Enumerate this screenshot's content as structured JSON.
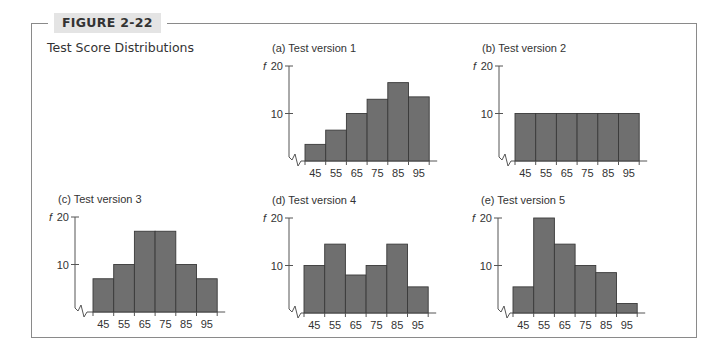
{
  "figure": {
    "label": "FIGURE 2-22",
    "title": "Test Score Distributions"
  },
  "style": {
    "bar_fill": "#6f6f6f",
    "bar_stroke": "#3a3a3a",
    "axis_color": "#555555",
    "frame_color": "#8a8a8a",
    "label_bg": "#e4e4e4"
  },
  "chart_data": [
    {
      "type": "bar",
      "title": "(a)  Test version 1",
      "xlabel": "",
      "ylabel": "f",
      "categories": [
        "45",
        "55",
        "65",
        "75",
        "85",
        "95"
      ],
      "values": [
        3.5,
        6.5,
        10,
        13,
        16.5,
        13.5
      ],
      "yticks": [
        10,
        20
      ],
      "ylim": [
        0,
        20
      ],
      "grid": false,
      "axis_break": true
    },
    {
      "type": "bar",
      "title": "(b)  Test version 2",
      "xlabel": "",
      "ylabel": "f",
      "categories": [
        "45",
        "55",
        "65",
        "75",
        "85",
        "95"
      ],
      "values": [
        10,
        10,
        10,
        10,
        10,
        10
      ],
      "yticks": [
        10,
        20
      ],
      "ylim": [
        0,
        20
      ],
      "grid": false,
      "axis_break": true
    },
    {
      "type": "bar",
      "title": "(c)  Test version 3",
      "xlabel": "",
      "ylabel": "f",
      "categories": [
        "45",
        "55",
        "65",
        "75",
        "85",
        "95"
      ],
      "values": [
        7,
        10,
        17,
        17,
        10,
        7
      ],
      "yticks": [
        10,
        20
      ],
      "ylim": [
        0,
        20
      ],
      "grid": false,
      "axis_break": true
    },
    {
      "type": "bar",
      "title": "(d)  Test version 4",
      "xlabel": "",
      "ylabel": "f",
      "categories": [
        "45",
        "55",
        "65",
        "75",
        "85",
        "95"
      ],
      "values": [
        10,
        14.5,
        8,
        10,
        14.5,
        5.5
      ],
      "yticks": [
        10,
        20
      ],
      "ylim": [
        0,
        20
      ],
      "grid": false,
      "axis_break": true
    },
    {
      "type": "bar",
      "title": "(e)  Test version 5",
      "xlabel": "",
      "ylabel": "f",
      "categories": [
        "45",
        "55",
        "65",
        "75",
        "85",
        "95"
      ],
      "values": [
        5.5,
        20,
        14.5,
        10,
        8.5,
        2
      ],
      "yticks": [
        10,
        20
      ],
      "ylim": [
        0,
        20
      ],
      "grid": false,
      "axis_break": true
    }
  ]
}
